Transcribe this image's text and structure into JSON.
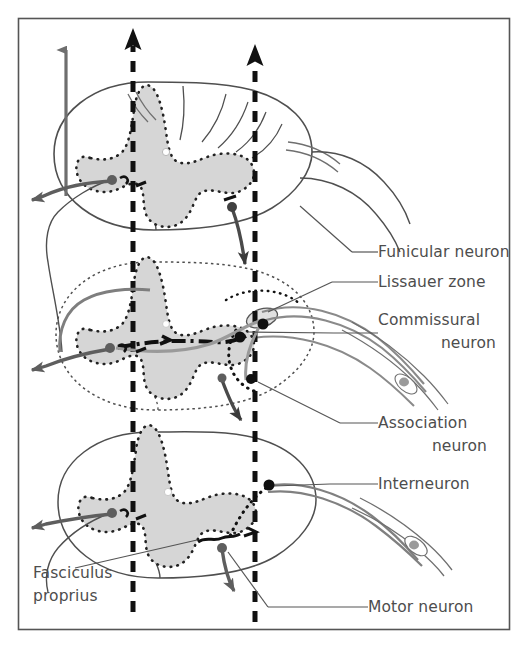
{
  "figure": {
    "domain": "anatomical-diagram",
    "background_color": "#ffffff",
    "frame": {
      "name": "figure-border",
      "x": 18,
      "y": 18,
      "width": 492,
      "height": 612,
      "stroke_color": "#555555",
      "stroke_width": 1.6
    },
    "colors": {
      "grey_matter_fill": "#d6d6d6",
      "outline_stroke": "#4f4f4f",
      "dotted_boundary": "#2b2b2b",
      "grey_neuron": "#6e6e6e",
      "black_neuron": "#101010",
      "label_text": "#4d4d4d",
      "leader_line": "#555555",
      "white_matter_fill": "#ffffff",
      "nerve_root_fill": "#ffffff"
    }
  },
  "labels": [
    {
      "id": "funicular",
      "text": "Funicular neuron",
      "x": 378,
      "y": 257,
      "lines": [
        "Funicular neuron"
      ]
    },
    {
      "id": "lissauer",
      "text": "Lissauer zone",
      "x": 378,
      "y": 287,
      "lines": [
        "Lissauer zone"
      ]
    },
    {
      "id": "commissural",
      "text": "Commissural neuron",
      "x": 378,
      "y": 325,
      "lines": [
        "Commissural",
        "neuron"
      ]
    },
    {
      "id": "association",
      "text": "Association neuron",
      "x": 378,
      "y": 428,
      "lines": [
        "Association",
        "neuron"
      ]
    },
    {
      "id": "interneuron",
      "text": "Interneuron",
      "x": 378,
      "y": 489,
      "lines": [
        "Interneuron"
      ]
    },
    {
      "id": "motor",
      "text": "Motor neuron",
      "x": 368,
      "y": 612,
      "lines": [
        "Motor neuron"
      ]
    },
    {
      "id": "fasciculus",
      "text": "Fasciculus proprius",
      "x": 33,
      "y": 578,
      "lines": [
        "Fasciculus",
        "proprius"
      ]
    }
  ],
  "leader_lines": [
    {
      "id": "leader-funicular",
      "points": "352,252 378,252"
    },
    {
      "id": "leader-lissauer",
      "points": "332,282 378,282"
    },
    {
      "id": "leader-commissural",
      "points": "334,333 378,333"
    },
    {
      "id": "leader-association",
      "points": "340,423 378,423"
    },
    {
      "id": "leader-interneuron",
      "points": "330,484 378,484"
    },
    {
      "id": "leader-motor",
      "points": "268,607 368,607"
    },
    {
      "id": "leader-fasciculus",
      "points": "75,568 197,540"
    }
  ],
  "vertical_tracts": [
    {
      "id": "ascending-grey-arrow",
      "name": "funicular-ascending-tract",
      "x": 66,
      "y_top": 48,
      "y_bottom": 175,
      "style": "solid",
      "color": "#6e6e6e",
      "arrow": "up"
    },
    {
      "id": "dashed-arrow-left",
      "name": "fasciculus-proprius-tract-left",
      "x": 133,
      "y_top": 32,
      "y_bottom": 612,
      "style": "dashed",
      "color": "#101010",
      "arrow": "up"
    },
    {
      "id": "dashed-arrow-right",
      "name": "fasciculus-proprius-tract-right",
      "x": 255,
      "y_top": 48,
      "y_bottom": 620,
      "style": "dashed",
      "color": "#101010",
      "arrow": "up"
    }
  ],
  "sections": [
    {
      "id": "section-upper",
      "name": "spinal-cord-cross-section-upper",
      "cy": 160
    },
    {
      "id": "section-middle",
      "name": "spinal-cord-cross-section-middle",
      "cy": 350
    },
    {
      "id": "section-lower",
      "name": "spinal-cord-cross-section-lower",
      "cy": 518
    }
  ],
  "neuron_markers": [
    {
      "id": "soma-upper-left",
      "name": "funicular-neuron-soma",
      "cx": 112,
      "cy": 180,
      "r": 5.0,
      "color": "#5e5e5e"
    },
    {
      "id": "soma-upper-right",
      "name": "funicular-neuron-soma-2",
      "cx": 232,
      "cy": 207,
      "r": 5.0,
      "color": "#404040"
    },
    {
      "id": "soma-mid-left",
      "name": "commissural-neuron-soma",
      "cx": 110,
      "cy": 348,
      "r": 5.0,
      "color": "#5e5e5e"
    },
    {
      "id": "soma-mid-right-a",
      "name": "association-neuron-soma",
      "cx": 240,
      "cy": 337,
      "r": 5.5,
      "color": "#101010"
    },
    {
      "id": "soma-mid-right-b",
      "name": "lissauer-entry-soma",
      "cx": 263,
      "cy": 324,
      "r": 5.5,
      "color": "#101010"
    },
    {
      "id": "soma-mid-right-c",
      "name": "association-neuron-soma-2",
      "cx": 251,
      "cy": 379,
      "r": 5.0,
      "color": "#101010"
    },
    {
      "id": "soma-mid-bottom",
      "name": "motor-neuron-soma-mid",
      "cx": 222,
      "cy": 378,
      "r": 4.5,
      "color": "#5e5e5e"
    },
    {
      "id": "soma-low-left",
      "name": "funicular-neuron-soma-3",
      "cx": 112,
      "cy": 513,
      "r": 5.0,
      "color": "#5e5e5e"
    },
    {
      "id": "soma-low-right",
      "name": "interneuron-soma",
      "cx": 269,
      "cy": 485,
      "r": 5.5,
      "color": "#101010"
    },
    {
      "id": "soma-low-motor",
      "name": "motor-neuron-soma",
      "cx": 222,
      "cy": 548,
      "r": 5.0,
      "color": "#5e5e5e"
    },
    {
      "id": "ganglion-upper",
      "name": "spinal-ganglion-cell",
      "cx": 404,
      "cy": 382,
      "r": 5.5,
      "color": "#8a8a8a"
    },
    {
      "id": "ganglion-lower",
      "name": "spinal-ganglion-cell-2",
      "cx": 414,
      "cy": 545,
      "r": 5.5,
      "color": "#8a8a8a"
    }
  ],
  "output_arrows": [
    {
      "id": "out-upper",
      "name": "funicular-axon-output-upper",
      "tip_x": 30,
      "tip_y": 200
    },
    {
      "id": "out-mid",
      "name": "funicular-axon-output-mid",
      "tip_x": 30,
      "tip_y": 370
    },
    {
      "id": "out-low",
      "name": "funicular-axon-output-lower",
      "tip_x": 30,
      "tip_y": 528
    },
    {
      "id": "down-mid",
      "name": "descending-axon-mid",
      "tip_x": 245,
      "tip_y": 425
    },
    {
      "id": "down-low",
      "name": "descending-axon-lower",
      "tip_x": 237,
      "tip_y": 596
    },
    {
      "id": "down-up",
      "name": "descending-axon-upper",
      "tip_x": 248,
      "tip_y": 270
    }
  ]
}
